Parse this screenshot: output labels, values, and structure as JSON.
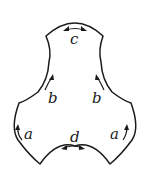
{
  "diagram": {
    "type": "surface-polygon-with-edge-identifications",
    "stroke_color": "#1a1a1a",
    "background": "#ffffff",
    "edge_labels": {
      "top": "c",
      "left_neck": "b",
      "right_neck": "b",
      "left_lobe": "a",
      "right_lobe": "a",
      "bottom": "d"
    },
    "arrows": {
      "top": "double-headed",
      "left_neck": "up",
      "right_neck": "up",
      "left_lobe": "up",
      "right_lobe": "up",
      "bottom": "double-headed"
    }
  }
}
